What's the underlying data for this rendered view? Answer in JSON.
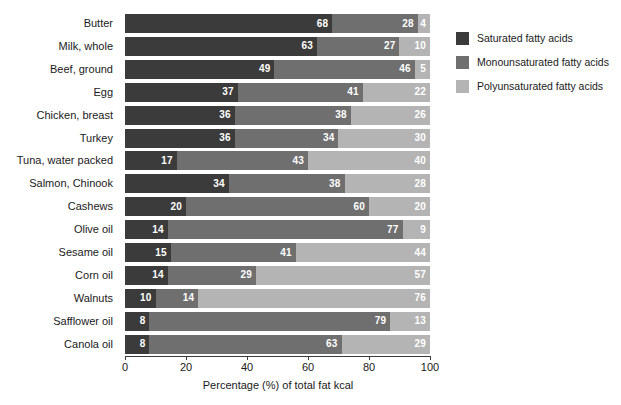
{
  "chart_data": {
    "type": "bar",
    "subtype": "stacked-horizontal-100",
    "title": "",
    "xlabel": "Percentage (%) of total fat kcal",
    "ylabel": "",
    "xlim": [
      0,
      100
    ],
    "xticks": [
      0,
      20,
      40,
      60,
      80,
      100
    ],
    "xtick_labels": [
      "0",
      "20",
      "40",
      "60",
      "80",
      "100"
    ],
    "grid": false,
    "legend_position": "right",
    "categories": [
      "Butter",
      "Milk, whole",
      "Beef, ground",
      "Egg",
      "Chicken, breast",
      "Turkey",
      "Tuna, water packed",
      "Salmon, Chinook",
      "Cashews",
      "Olive oil",
      "Sesame oil",
      "Corn oil",
      "Walnuts",
      "Safflower oil",
      "Canola oil"
    ],
    "series": [
      {
        "name": "Saturated fatty acids",
        "color": "#3b3b3b",
        "values": [
          68,
          63,
          49,
          37,
          36,
          36,
          17,
          34,
          20,
          14,
          15,
          14,
          10,
          8,
          8
        ]
      },
      {
        "name": "Monounsaturated fatty acids",
        "color": "#6f6f6f",
        "values": [
          28,
          27,
          46,
          41,
          38,
          34,
          43,
          38,
          60,
          77,
          41,
          29,
          14,
          79,
          63
        ]
      },
      {
        "name": "Polyunsaturated fatty acids",
        "color": "#b4b4b4",
        "values": [
          4,
          10,
          5,
          22,
          26,
          30,
          40,
          28,
          20,
          9,
          44,
          57,
          76,
          13,
          29
        ]
      }
    ]
  },
  "legend": {
    "items": [
      {
        "label": "Saturated fatty acids",
        "color": "#3b3b3b"
      },
      {
        "label": "Monounsaturated fatty acids",
        "color": "#6f6f6f"
      },
      {
        "label": "Polyunsaturated fatty acids",
        "color": "#b4b4b4"
      }
    ]
  }
}
